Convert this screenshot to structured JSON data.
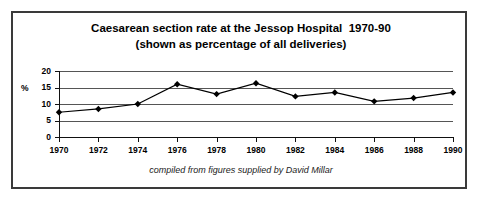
{
  "chart_data": {
    "type": "line",
    "title": "Caesarean section rate at the Jessop Hospital  1970-90",
    "subtitle": "(shown as percentage of all deliveries)",
    "caption": "compiled from figures supplied by David Millar",
    "xlabel": "",
    "ylabel": "%",
    "ylim": [
      0,
      20
    ],
    "yticks": [
      0,
      5,
      10,
      15,
      20
    ],
    "ytick_labels": [
      "0",
      "5",
      "10",
      "15",
      "20"
    ],
    "grid": true,
    "legend": "none",
    "marker": "diamond",
    "line_color": "#000000",
    "marker_color": "#000000",
    "gridline_color": "#555555",
    "categories": [
      1970,
      1972,
      1974,
      1976,
      1978,
      1980,
      1982,
      1984,
      1986,
      1988,
      1990
    ],
    "xtick_labels": [
      "1970",
      "1972",
      "1974",
      "1976",
      "1978",
      "1980",
      "1982",
      "1984",
      "1986",
      "1988",
      "1990"
    ],
    "values": [
      7.5,
      8.5,
      10.0,
      16.0,
      13.0,
      16.3,
      12.3,
      13.5,
      10.8,
      11.8,
      13.5
    ]
  },
  "frame": {
    "border_color": "#3a3a3a",
    "background": "#ffffff"
  }
}
